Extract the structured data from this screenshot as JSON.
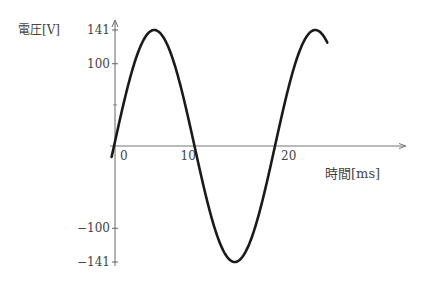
{
  "chart_data": {
    "type": "line",
    "title": "",
    "ylabel": "電圧[V]",
    "xlabel": "時間[ms]",
    "y_ticks": [
      {
        "value": 141,
        "label": "141"
      },
      {
        "value": 100,
        "label": "100"
      },
      {
        "value": -100,
        "label": "−100"
      },
      {
        "value": -141,
        "label": "−141"
      }
    ],
    "x_ticks": [
      {
        "value": 0,
        "label": "0"
      },
      {
        "value": 10,
        "label": "10"
      },
      {
        "value": 20,
        "label": "20"
      }
    ],
    "xlim": [
      -0.3,
      27
    ],
    "ylim": [
      -141,
      141
    ],
    "series": [
      {
        "name": "v(t) = 141 sin(2π·50·t)",
        "function": "sine",
        "amplitude": 141,
        "period_ms": 20,
        "phase": 0,
        "t_start_ms": -0.3,
        "t_end_ms": 26.5
      }
    ],
    "grid": false,
    "legend": "none"
  }
}
